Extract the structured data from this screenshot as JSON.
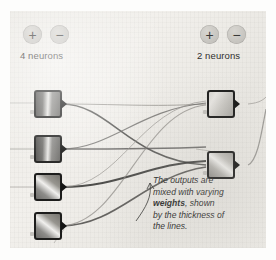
{
  "canvas": {
    "background_color": "#eeece7",
    "paper_texture": true
  },
  "left_group": {
    "label": "4 neurons",
    "neuron_count": 4,
    "add_button": {
      "name": "plus",
      "glyph": "+"
    },
    "remove_button": {
      "name": "minus",
      "glyph": "−"
    }
  },
  "right_group": {
    "label": "2 neurons",
    "neuron_count": 2,
    "add_button": {
      "name": "plus",
      "glyph": "+"
    },
    "remove_button": {
      "name": "minus",
      "glyph": "−"
    }
  },
  "annotation": {
    "line1": "The outputs are",
    "line2": "mixed with varying",
    "line3_bold": "weights",
    "line3_rest": ", shown",
    "line4": "by the thickness of",
    "line5": "the lines."
  },
  "colors": {
    "ink": "#2b2b2a",
    "neuron_border": "#1d1d1c",
    "button_face": "#c9c7c2",
    "wire_dark": "#3f3f3e",
    "wire_light": "#9a9893"
  }
}
